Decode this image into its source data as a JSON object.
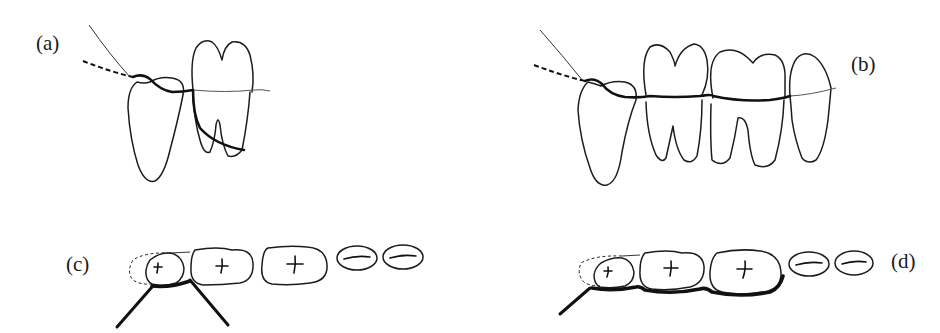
{
  "figure": {
    "panels": [
      {
        "id": "a",
        "label": "(a)",
        "view": "lateral",
        "description": "Floss wrapped around distal surface of last molar, passing into interproximal space"
      },
      {
        "id": "b",
        "label": "(b)",
        "view": "lateral",
        "description": "Floss run along cervical line across several teeth"
      },
      {
        "id": "c",
        "label": "(c)",
        "view": "occlusal",
        "description": "Floss held in V-shape around distal surface of last molar"
      },
      {
        "id": "d",
        "label": "(d)",
        "view": "occlusal",
        "description": "Floss wrapped along lingual/buccal surfaces of multiple teeth"
      }
    ],
    "colors": {
      "background": "#ffffff",
      "ink": "#1c1c1c"
    }
  }
}
